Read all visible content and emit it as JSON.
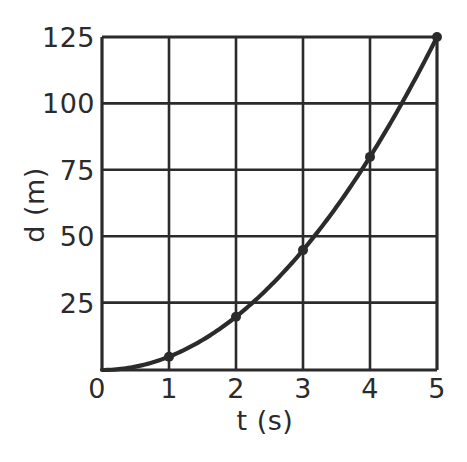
{
  "chart_data": {
    "type": "line",
    "title": "",
    "subtitle": "",
    "xlabel": "t (s)",
    "ylabel": "d (m)",
    "xlim": [
      0,
      5
    ],
    "ylim": [
      0,
      125
    ],
    "grid": true,
    "legend": "none",
    "x_ticks": [
      "0",
      "1",
      "2",
      "3",
      "4",
      "5"
    ],
    "x_tick_values": [
      0,
      1,
      2,
      3,
      4,
      5
    ],
    "y_ticks": [
      "25",
      "50",
      "75",
      "100",
      "125"
    ],
    "y_tick_values": [
      25,
      50,
      75,
      100,
      125
    ],
    "series": [
      {
        "name": "d = 5t²",
        "x": [
          0,
          1,
          2,
          3,
          4,
          5
        ],
        "values": [
          0,
          5,
          20,
          45,
          80,
          125
        ],
        "marker": "filled-circle",
        "color": "#2b2b2b"
      }
    ],
    "annotations": []
  },
  "colors": {
    "background": "#ffffff",
    "ink": "#2b2b2b",
    "curve": "#2b2b2b",
    "grid": "#2b2b2b"
  },
  "axes": {
    "x_title": "t (s)",
    "y_title": "d (m)",
    "x_tick_labels": [
      "0",
      "1",
      "2",
      "3",
      "4",
      "5"
    ],
    "y_tick_labels": [
      "125",
      "100",
      "75",
      "50",
      "25"
    ]
  }
}
